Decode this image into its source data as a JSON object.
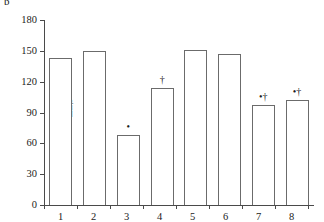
{
  "panel": {
    "label": "b"
  },
  "axes": {
    "y_label_delta": "Δ",
    "y_label_var": "L",
    "y_label_sub": ",s",
    "y_ticks": [
      "0",
      "30",
      "60",
      "90",
      "120",
      "150",
      "180"
    ],
    "y_tick_values": [
      0,
      30,
      60,
      90,
      120,
      150,
      180
    ],
    "y_min": 0,
    "y_max": 180,
    "x_ticks": [
      "1",
      "2",
      "3",
      "4",
      "5",
      "6",
      "7",
      "8"
    ]
  },
  "annotations": {
    "asterisk": "•",
    "dagger": "†",
    "asterisk_dagger": "•†"
  },
  "chart_data": {
    "type": "bar",
    "title": "",
    "subtitle": "",
    "panel_label": "b",
    "xlabel": "",
    "ylabel": "ΔL,s",
    "categories": [
      "1",
      "2",
      "3",
      "4",
      "5",
      "6",
      "7",
      "8"
    ],
    "values": [
      143,
      150,
      68,
      114,
      151,
      147,
      97,
      102
    ],
    "point_annotations": [
      "",
      "",
      "•",
      "†",
      "",
      "",
      "•†",
      "•†"
    ],
    "ylim": [
      0,
      180
    ],
    "ytick_values": [
      0,
      30,
      60,
      90,
      120,
      150,
      180
    ],
    "grid": false,
    "legend": null,
    "bar_fill": "#ffffff",
    "bar_edge": "#6b6b6b",
    "axis_color": "#4a4a4a"
  }
}
